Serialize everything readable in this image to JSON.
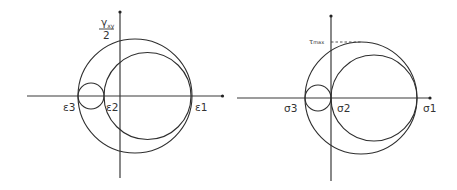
{
  "diagrams": [
    {
      "name": "strain-mohr-circle",
      "axes": {
        "horizontal_label": "",
        "vertical_label_top": "γ",
        "vertical_label_sub": "xy",
        "vertical_label_den": "2"
      },
      "labels": {
        "e3": "ε3",
        "e2": "ε2",
        "e1": "ε1"
      },
      "geometry": {
        "origin_x": 120,
        "axis_y": 96,
        "x_axis": [
          27,
          223
        ],
        "y_axis": [
          10,
          178
        ],
        "large_circle": {
          "cx": 135,
          "r": 57
        },
        "medium_circle": {
          "cx": 147.5,
          "r": 43.5
        },
        "small_circle": {
          "cx": 91,
          "r": 13
        }
      }
    },
    {
      "name": "stress-mohr-circle",
      "labels": {
        "s3": "σ3",
        "s2": "σ2",
        "s1": "σ1",
        "tau_max": "τ",
        "tau_max_sub": "max"
      },
      "geometry": {
        "origin_x": 331,
        "axis_y": 98,
        "x_axis": [
          237,
          430
        ],
        "y_axis": [
          15,
          180
        ],
        "large_circle": {
          "cx": 361,
          "r": 56
        },
        "medium_circle": {
          "cx": 374,
          "r": 43
        },
        "small_circle": {
          "cx": 318,
          "r": 13
        }
      }
    }
  ],
  "colors": {
    "line": "#2e2e2e",
    "background": "#ffffff"
  }
}
